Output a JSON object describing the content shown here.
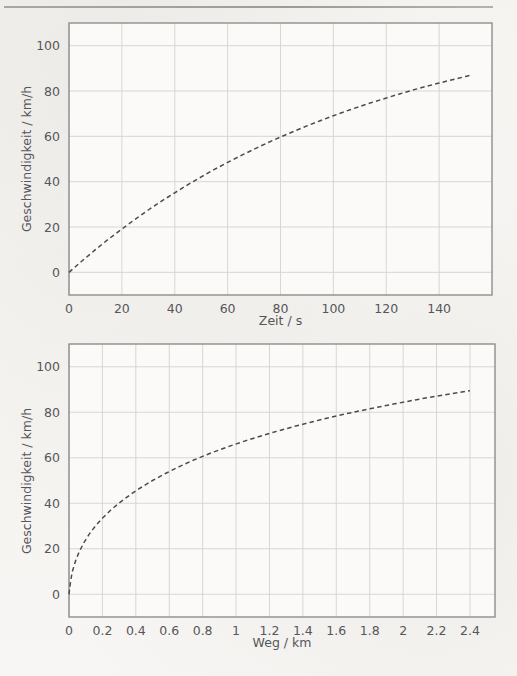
{
  "page": {
    "background_color": "#f5f4f1",
    "header_rule_color": "#929290"
  },
  "charts": [
    {
      "id": "chart-top",
      "name": "speed-vs-time-chart",
      "type": "line",
      "title": "",
      "xlabel": "Zeit / s",
      "ylabel": "Geschwindigkeit / km/h",
      "xlim": [
        0,
        160
      ],
      "ylim": [
        -10,
        110
      ],
      "xticks": [
        0,
        20,
        40,
        60,
        80,
        100,
        120,
        140
      ],
      "xtick_labels": [
        "0",
        "20",
        "40",
        "60",
        "80",
        "100",
        "120",
        "140"
      ],
      "yticks": [
        0,
        20,
        40,
        60,
        80,
        100
      ],
      "ytick_labels": [
        "0",
        "20",
        "40",
        "60",
        "80",
        "100"
      ],
      "grid": true,
      "line_style": "dashed",
      "line_color": "#4b4b4f",
      "grid_color": "#d2d2ce",
      "frame_color": "#8e8e8c",
      "legend": "none",
      "x": [
        0,
        5,
        10,
        15,
        20,
        25,
        30,
        35,
        40,
        45,
        50,
        55,
        60,
        65,
        70,
        75,
        80,
        85,
        90,
        95,
        100,
        105,
        110,
        115,
        120,
        125,
        130,
        135,
        140,
        145,
        150,
        152
      ],
      "y": [
        0,
        5.1,
        10.0,
        14.7,
        19.1,
        23.4,
        27.5,
        31.4,
        35.1,
        38.7,
        42.1,
        45.4,
        48.5,
        51.5,
        54.3,
        57.1,
        59.7,
        62.2,
        64.6,
        66.9,
        69.1,
        71.2,
        73.2,
        75.1,
        76.9,
        78.7,
        80.4,
        82.0,
        83.5,
        85.0,
        86.4,
        87.0
      ]
    },
    {
      "id": "chart-bottom",
      "name": "speed-vs-distance-chart",
      "type": "line",
      "title": "",
      "xlabel": "Weg / km",
      "ylabel": "Geschwindigkeit / km/h",
      "xlim": [
        0,
        2.55
      ],
      "ylim": [
        -10,
        110
      ],
      "xticks": [
        0,
        0.2,
        0.4,
        0.6,
        0.8,
        1,
        1.2,
        1.4,
        1.6,
        1.8,
        2,
        2.2,
        2.4
      ],
      "xtick_labels": [
        "0",
        "0.2",
        "0.4",
        "0.6",
        "0.8",
        "1",
        "1.2",
        "1.4",
        "1.6",
        "1.8",
        "2",
        "2.2",
        "2.4"
      ],
      "yticks": [
        0,
        20,
        40,
        60,
        80,
        100
      ],
      "ytick_labels": [
        "0",
        "20",
        "40",
        "60",
        "80",
        "100"
      ],
      "grid": true,
      "line_style": "dashed",
      "line_color": "#4b4b4f",
      "grid_color": "#d2d2ce",
      "frame_color": "#8e8e8c",
      "legend": "none",
      "x": [
        0,
        0.01,
        0.02,
        0.04,
        0.06,
        0.09,
        0.12,
        0.16,
        0.2,
        0.25,
        0.3,
        0.36,
        0.42,
        0.5,
        0.58,
        0.66,
        0.75,
        0.85,
        0.95,
        1.05,
        1.2,
        1.35,
        1.5,
        1.65,
        1.8,
        1.95,
        2.1,
        2.25,
        2.4
      ],
      "y": [
        0,
        6.0,
        10.0,
        14.8,
        18.5,
        22.8,
        26.3,
        30.2,
        33.4,
        37.0,
        40.1,
        43.4,
        46.4,
        50.0,
        53.2,
        56.1,
        59.1,
        62.1,
        64.8,
        67.3,
        70.7,
        73.8,
        76.6,
        79.2,
        81.5,
        83.7,
        85.8,
        87.7,
        89.5
      ]
    }
  ],
  "chart_data": [
    {
      "type": "line",
      "title": "Geschwindigkeit / km/h vs Zeit / s",
      "xlabel": "Zeit / s",
      "ylabel": "Geschwindigkeit / km/h",
      "xlim": [
        0,
        160
      ],
      "ylim": [
        -10,
        110
      ],
      "xticks": [
        0,
        20,
        40,
        60,
        80,
        100,
        120,
        140
      ],
      "yticks": [
        0,
        20,
        40,
        60,
        80,
        100
      ],
      "grid": true,
      "legend": "none",
      "series": [
        {
          "name": "Geschwindigkeit",
          "style": "dashed",
          "x": [
            0,
            10,
            20,
            30,
            40,
            50,
            60,
            70,
            80,
            90,
            100,
            110,
            120,
            130,
            140,
            150,
            152
          ],
          "y": [
            0,
            10.0,
            19.1,
            27.5,
            35.1,
            42.1,
            48.5,
            54.3,
            59.7,
            64.6,
            69.1,
            73.2,
            76.9,
            80.4,
            83.5,
            86.4,
            87.0
          ]
        }
      ],
      "notes": "Saturating (exponential-approach) speed curve rising from 0 km/h at t=0 s to about 101 km/h at t = 152 s"
    },
    {
      "type": "line",
      "title": "Geschwindigkeit / km/h vs Weg / km",
      "xlabel": "Weg / km",
      "ylabel": "Geschwindigkeit / km/h",
      "xlim": [
        0,
        2.55
      ],
      "ylim": [
        -10,
        110
      ],
      "xticks": [
        0,
        0.2,
        0.4,
        0.6,
        0.8,
        1,
        1.2,
        1.4,
        1.6,
        1.8,
        2,
        2.2,
        2.4
      ],
      "yticks": [
        0,
        20,
        40,
        60,
        80,
        100
      ],
      "grid": true,
      "legend": "none",
      "series": [
        {
          "name": "Geschwindigkeit",
          "style": "dashed",
          "x": [
            0,
            0.05,
            0.1,
            0.2,
            0.3,
            0.4,
            0.5,
            0.6,
            0.8,
            1.0,
            1.2,
            1.4,
            1.6,
            1.8,
            2.0,
            2.2,
            2.4
          ],
          "y": [
            0,
            17.5,
            24.0,
            33.4,
            40.1,
            45.4,
            50.0,
            54.0,
            60.9,
            66.6,
            70.7,
            74.5,
            78.0,
            81.5,
            84.4,
            87.2,
            89.5
          ]
        }
      ],
      "notes": "Steeply rising root-like speed curve from 0 km/h at s=0 km to about 101 km/h at s = 2.4 km"
    }
  ]
}
